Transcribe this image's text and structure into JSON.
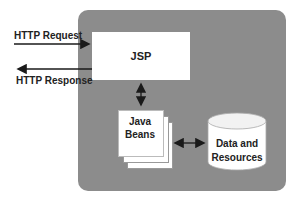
{
  "diagram": {
    "external": {
      "request_label": "HTTP Request",
      "response_label": "HTTP Response"
    },
    "nodes": {
      "jsp": "JSP",
      "beans_line1": "Java",
      "beans_line2": "Beans",
      "data_line1": "Data and",
      "data_line2": "Resources"
    },
    "colors": {
      "container": "#8c8c8c",
      "box": "#ffffff",
      "arrow": "#1a1a1a"
    },
    "edges": [
      {
        "from": "client",
        "to": "JSP",
        "label": "HTTP Request"
      },
      {
        "from": "JSP",
        "to": "client",
        "label": "HTTP Response"
      },
      {
        "from": "JSP",
        "to": "Java Beans",
        "bidirectional": true
      },
      {
        "from": "Java Beans",
        "to": "Data and Resources",
        "bidirectional": true
      }
    ]
  }
}
